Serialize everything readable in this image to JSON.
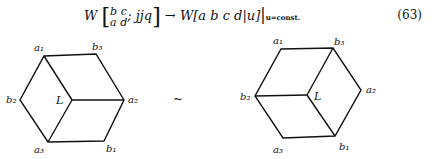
{
  "equation": {
    "lhs": "W",
    "matrix_top": "b  c",
    "matrix_bottom": "a  d",
    "args": "; jjq",
    "arrow": "→",
    "rhs": "W[a b c d|u]",
    "subscript": "u=const.",
    "number": "(63)"
  },
  "diagrams": {
    "left": {
      "labels": {
        "a1": "a₁",
        "b3": "b₃",
        "a2": "a₂",
        "b1": "b₁",
        "a3": "a₃",
        "b2": "b₂",
        "L": "L"
      }
    },
    "relation": "~",
    "right": {
      "labels": {
        "a1": "a₁",
        "b3": "b₃",
        "a2": "a₂",
        "b1": "b₁",
        "a3": "a₃",
        "b2": "b₂",
        "L": "L"
      }
    }
  }
}
